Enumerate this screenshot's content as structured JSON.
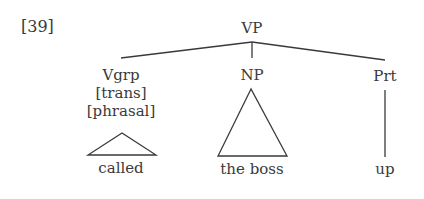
{
  "example": {
    "number": "[39]"
  },
  "tree": {
    "root": {
      "label": "VP"
    },
    "children": [
      {
        "label": "Vgrp",
        "features": [
          "[trans]",
          "[phrasal]"
        ],
        "leaf_style": "triangle",
        "leaf": "called"
      },
      {
        "label": "NP",
        "features": [],
        "leaf_style": "triangle",
        "leaf": "the boss"
      },
      {
        "label": "Prt",
        "features": [],
        "leaf_style": "line",
        "leaf": "up"
      }
    ]
  },
  "colors": {
    "ink": "#3a3a3a",
    "background": "#ffffff"
  }
}
